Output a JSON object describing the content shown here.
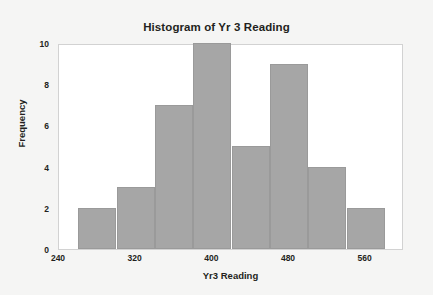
{
  "chart_data": {
    "type": "bar",
    "title": "Histogram of Yr 3 Reading",
    "xlabel": "Yr3 Reading",
    "ylabel": "Frequency",
    "categories": [
      "260-300",
      "300-340",
      "340-380",
      "380-420",
      "420-460",
      "460-500",
      "500-540",
      "540-580"
    ],
    "bin_edges": [
      260,
      300,
      340,
      380,
      420,
      460,
      500,
      540,
      580
    ],
    "bin_width": 40,
    "values": [
      2,
      3,
      7,
      10,
      5,
      9,
      4,
      2
    ],
    "xlim": [
      240,
      600
    ],
    "ylim": [
      0,
      10
    ],
    "xticks": [
      240,
      320,
      400,
      480,
      560
    ],
    "xtick_labels": [
      "240",
      "320",
      "400",
      "480",
      "560"
    ],
    "yticks": [
      0,
      2,
      4,
      6,
      8,
      10
    ],
    "ytick_labels": [
      "0",
      "2",
      "4",
      "6",
      "8",
      "10"
    ],
    "grid": false,
    "legend": null,
    "bar_color": "#a6a6a6",
    "plot_background": "#ffffff",
    "figure_background": "#f5f5f4",
    "text_color": "#231f20",
    "total_count": 42
  }
}
